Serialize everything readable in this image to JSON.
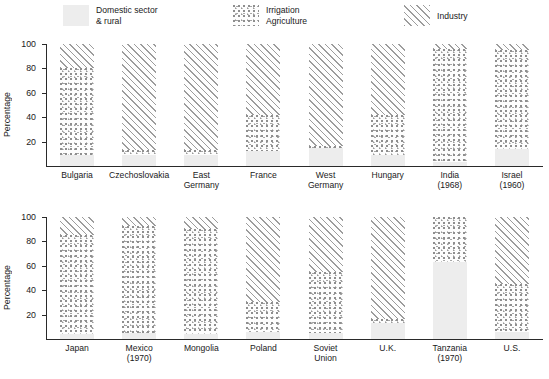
{
  "legend": {
    "items": [
      {
        "key": "domestic",
        "label": "Domestic sector\n& rural",
        "pattern": "solid-light-gray",
        "color": "#ededed"
      },
      {
        "key": "agriculture",
        "label": "Irrigation\nAgriculture",
        "pattern": "stipple-dots",
        "color": "#9a9a9a"
      },
      {
        "key": "industry",
        "label": "Industry",
        "pattern": "diagonal-hatch",
        "color": "#9c9c9c"
      }
    ]
  },
  "axis": {
    "ylabel": "Percentage",
    "yticks": [
      "20",
      "40",
      "60",
      "80",
      "100"
    ],
    "ytick_values": [
      20,
      40,
      60,
      80,
      100
    ],
    "ymin": 0,
    "ymax": 100
  },
  "chart_data": {
    "type": "bar",
    "subtype": "stacked-bar",
    "title": "",
    "xlabel": "",
    "ylabel": "Percentage",
    "ylim": [
      0,
      100
    ],
    "grid": false,
    "legend_position": "top",
    "series": [
      {
        "name": "Domestic sector & rural",
        "key": "domestic"
      },
      {
        "name": "Irrigation Agriculture",
        "key": "agriculture"
      },
      {
        "name": "Industry",
        "key": "industry"
      }
    ],
    "panels": [
      {
        "index": 0,
        "categories": [
          "Bulgaria",
          "Czechoslovakia",
          "East\nGermany",
          "France",
          "West\nGermany",
          "Hungary",
          "India\n(1968)",
          "Israel\n(1960)"
        ],
        "values": {
          "domestic": [
            9,
            9,
            9,
            12,
            15,
            9,
            3,
            14
          ],
          "agriculture": [
            71,
            4,
            4,
            30,
            1,
            33,
            93,
            81
          ],
          "industry": [
            20,
            87,
            87,
            58,
            84,
            58,
            4,
            5
          ]
        }
      },
      {
        "index": 1,
        "categories": [
          "Japan",
          "Mexico\n(1970)",
          "Mongolia",
          "Poland",
          "Soviet\nUnion",
          "U.K.",
          "Tanzania\n(1970)",
          "U.S."
        ],
        "values": {
          "domestic": [
            4,
            5,
            4,
            6,
            5,
            13,
            63,
            6
          ],
          "agriculture": [
            81,
            88,
            86,
            24,
            50,
            3,
            37,
            39
          ],
          "industry": [
            15,
            7,
            10,
            70,
            45,
            84,
            0,
            55
          ]
        }
      }
    ]
  }
}
